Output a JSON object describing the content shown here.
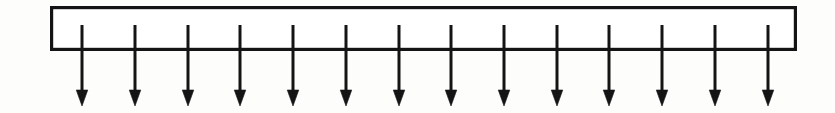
{
  "figure": {
    "name": "uniformly-distributed-load-diagram",
    "domain": "engineering-statics-diagram",
    "canvas": {
      "width": 835,
      "height": 113,
      "background_color": "#fdfdfc"
    },
    "stroke_color": "#141414",
    "fill_color": "#ffffff"
  },
  "load_block": {
    "name": "load-rectangle",
    "shape": "rectangle",
    "x": 50,
    "y": 6,
    "width": 747,
    "height": 45,
    "stroke_width": 3.2,
    "fill": "#ffffff",
    "stroke": "#141414"
  },
  "arrows": {
    "name": "load-arrow-group",
    "count": 14,
    "direction": "down",
    "shaft_top_y": 25,
    "shaft_bottom_y": 91,
    "shaft_width": 3.0,
    "head_width": 11.5,
    "head_height": 16,
    "tip_y": 106,
    "stroke": "#141414",
    "x_positions": [
      82,
      135,
      188,
      240,
      293,
      346,
      399,
      451,
      504,
      557,
      609,
      662,
      715,
      768
    ],
    "spacing": 52.8,
    "labels": [
      "load-arrow-1",
      "load-arrow-2",
      "load-arrow-3",
      "load-arrow-4",
      "load-arrow-5",
      "load-arrow-6",
      "load-arrow-7",
      "load-arrow-8",
      "load-arrow-9",
      "load-arrow-10",
      "load-arrow-11",
      "load-arrow-12",
      "load-arrow-13",
      "load-arrow-14"
    ]
  },
  "annotations": {
    "text_labels": []
  }
}
